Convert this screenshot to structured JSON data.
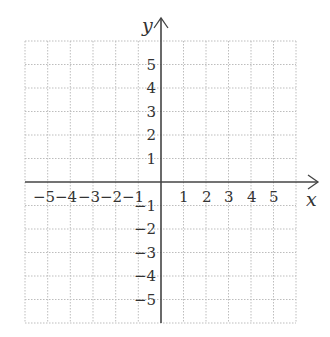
{
  "diagram": {
    "type": "cartesian-coordinate-grid",
    "x_axis": {
      "label": "x",
      "ticks": [
        "−5",
        "−4",
        "−3",
        "−2",
        "−1",
        "1",
        "2",
        "3",
        "4",
        "5"
      ],
      "range": [
        -6,
        6
      ]
    },
    "y_axis": {
      "label": "y",
      "ticks": [
        "5",
        "4",
        "3",
        "2",
        "1",
        "−1",
        "−2",
        "−3",
        "−4",
        "−5"
      ],
      "range": [
        -6,
        6
      ]
    },
    "grid": {
      "style": "dotted",
      "cells_x": 12,
      "cells_y": 12
    },
    "colors": {
      "axis": "#444444",
      "grid": "#bdbdbd",
      "text": "#333333",
      "background": "#ffffff"
    }
  }
}
